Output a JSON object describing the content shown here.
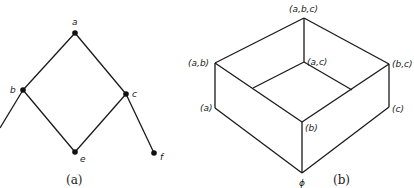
{
  "panel_a": {
    "caption": "(a)",
    "nodes": [
      {
        "id": "a",
        "label": "a"
      },
      {
        "id": "b",
        "label": "b"
      },
      {
        "id": "c",
        "label": "c"
      },
      {
        "id": "e",
        "label": "e"
      },
      {
        "id": "f",
        "label": "f"
      }
    ],
    "edges": [
      [
        "a",
        "b"
      ],
      [
        "a",
        "c"
      ],
      [
        "b",
        "e"
      ],
      [
        "c",
        "e"
      ],
      [
        "c",
        "f"
      ],
      [
        "b",
        "offscreen"
      ]
    ]
  },
  "panel_b": {
    "caption": "(b)",
    "labels": {
      "abc": "(a,b,c)",
      "ab": "(a,b)",
      "ac": "(a,c)",
      "bc": "(b,c)",
      "a": "(a)",
      "b": "(b)",
      "c": "(c)",
      "empty": "ϕ"
    }
  },
  "colors": {
    "line": "#1a1a1a",
    "background": "#ffffff"
  }
}
